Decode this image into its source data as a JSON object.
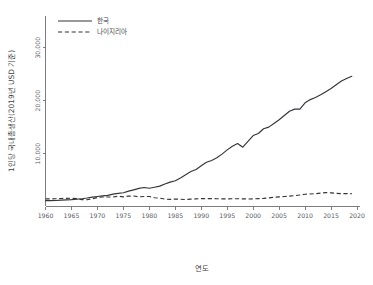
{
  "top_partial_text": "",
  "chart_data": {
    "type": "line",
    "title": "",
    "xlabel": "연도",
    "ylabel": "1인당 국내총생산(2019년 USD 기준)",
    "xlim": [
      1960,
      2020
    ],
    "ylim": [
      0,
      36000
    ],
    "xticks": [
      1960,
      1965,
      1970,
      1975,
      1980,
      1985,
      1990,
      1995,
      2000,
      2005,
      2010,
      2015,
      2020
    ],
    "xtick_labels": [
      "1960",
      "1965",
      "1970",
      "1975",
      "1980",
      "1985",
      "1990",
      "1995",
      "2000",
      "2005",
      "2010",
      "2015",
      "2020"
    ],
    "yticks": [
      10000,
      20000,
      30000
    ],
    "ytick_labels": [
      "10,000",
      "20,000",
      "30,000"
    ],
    "grid": false,
    "legend_position": "top-left",
    "series": [
      {
        "name": "한국",
        "style": "solid",
        "color": "#35353a",
        "x": [
          1960,
          1961,
          1962,
          1963,
          1964,
          1965,
          1966,
          1967,
          1968,
          1969,
          1970,
          1971,
          1972,
          1973,
          1974,
          1975,
          1976,
          1977,
          1978,
          1979,
          1980,
          1981,
          1982,
          1983,
          1984,
          1985,
          1986,
          1987,
          1988,
          1989,
          1990,
          1991,
          1992,
          1993,
          1994,
          1995,
          1996,
          1997,
          1998,
          1999,
          2000,
          2001,
          2002,
          2003,
          2004,
          2005,
          2006,
          2007,
          2008,
          2009,
          2010,
          2011,
          2012,
          2013,
          2014,
          2015,
          2016,
          2017,
          2018,
          2019
        ],
        "values": [
          1100,
          1120,
          1130,
          1200,
          1250,
          1290,
          1400,
          1470,
          1600,
          1780,
          1900,
          2020,
          2100,
          2340,
          2480,
          2600,
          2900,
          3150,
          3420,
          3600,
          3450,
          3650,
          3850,
          4250,
          4600,
          4880,
          5400,
          6000,
          6600,
          7000,
          7700,
          8350,
          8700,
          9200,
          9900,
          10700,
          11400,
          11900,
          11200,
          12300,
          13400,
          13800,
          14700,
          15000,
          15700,
          16400,
          17200,
          18000,
          18400,
          18400,
          19600,
          20200,
          20600,
          21100,
          21700,
          22300,
          23000,
          23700,
          24200,
          24600
        ]
      },
      {
        "name": "나이지리아",
        "style": "dashed",
        "color": "#35353a",
        "x": [
          1960,
          1961,
          1962,
          1963,
          1964,
          1965,
          1966,
          1967,
          1968,
          1969,
          1970,
          1971,
          1972,
          1973,
          1974,
          1975,
          1976,
          1977,
          1978,
          1979,
          1980,
          1981,
          1982,
          1983,
          1984,
          1985,
          1986,
          1987,
          1988,
          1989,
          1990,
          1991,
          1992,
          1993,
          1994,
          1995,
          1996,
          1997,
          1998,
          1999,
          2000,
          2001,
          2002,
          2003,
          2004,
          2005,
          2006,
          2007,
          2008,
          2009,
          2010,
          2011,
          2012,
          2013,
          2014,
          2015,
          2016,
          2017,
          2018,
          2019
        ],
        "values": [
          1450,
          1440,
          1470,
          1520,
          1530,
          1560,
          1500,
          1300,
          1280,
          1450,
          1700,
          1800,
          1790,
          1800,
          1950,
          1830,
          1950,
          1980,
          1830,
          1880,
          1900,
          1650,
          1580,
          1400,
          1340,
          1400,
          1370,
          1320,
          1400,
          1440,
          1500,
          1500,
          1490,
          1470,
          1440,
          1430,
          1470,
          1470,
          1450,
          1420,
          1450,
          1480,
          1530,
          1640,
          1740,
          1810,
          1880,
          1960,
          2050,
          2170,
          2310,
          2370,
          2430,
          2530,
          2630,
          2580,
          2470,
          2440,
          2440,
          2430
        ]
      }
    ]
  },
  "legend": {
    "items": [
      {
        "label": "한국",
        "style": "solid"
      },
      {
        "label": "나이지리아",
        "style": "dashed"
      }
    ]
  }
}
